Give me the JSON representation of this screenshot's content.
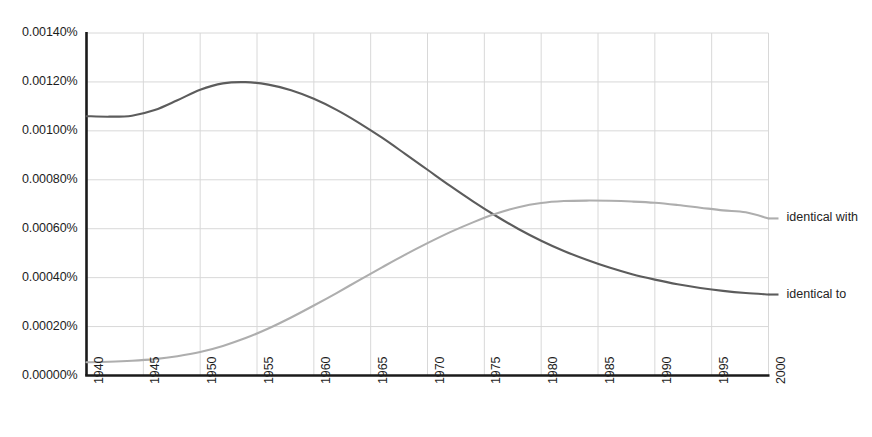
{
  "chart_data": {
    "type": "line",
    "title": "",
    "subtitle": "",
    "xlabel": "",
    "ylabel": "",
    "xlim": [
      1940,
      2000
    ],
    "ylim": [
      0.0,
      0.0014
    ],
    "grid": true,
    "legend_position": "right-inline",
    "y_tick_labels": [
      "0.00140%",
      "0.00120%",
      "0.00100%",
      "0.00080%",
      "0.00060%",
      "0.00040%",
      "0.00020%",
      "0.00000%"
    ],
    "y_tick_values": [
      0.0014,
      0.0012,
      0.001,
      0.0008,
      0.0006,
      0.0004,
      0.0002,
      0.0
    ],
    "x_tick_labels": [
      "1940",
      "1945",
      "1950",
      "1955",
      "1960",
      "1965",
      "1970",
      "1975",
      "1980",
      "1985",
      "1990",
      "1995",
      "2000"
    ],
    "x_tick_values": [
      1940,
      1945,
      1950,
      1955,
      1960,
      1965,
      1970,
      1975,
      1980,
      1985,
      1990,
      1995,
      2000
    ],
    "x": [
      1940,
      1942,
      1944,
      1946,
      1948,
      1950,
      1952,
      1954,
      1956,
      1958,
      1960,
      1962,
      1964,
      1966,
      1968,
      1970,
      1972,
      1974,
      1976,
      1978,
      1980,
      1982,
      1984,
      1986,
      1988,
      1990,
      1992,
      1994,
      1996,
      1998,
      2000
    ],
    "series": [
      {
        "name": "identical to",
        "color": "#5c5c5c",
        "values": [
          0.00106,
          0.001058,
          0.001062,
          0.001085,
          0.001125,
          0.001168,
          0.001194,
          0.001199,
          0.001189,
          0.001166,
          0.001131,
          0.001086,
          0.001032,
          0.000972,
          0.000907,
          0.000841,
          0.000775,
          0.000712,
          0.000653,
          0.000599,
          0.000551,
          0.000509,
          0.000473,
          0.000441,
          0.000414,
          0.000392,
          0.000373,
          0.000358,
          0.000346,
          0.000337,
          0.000331
        ]
      },
      {
        "name": "identical with",
        "color": "#aeaeae",
        "values": [
          5.4e-05,
          5.6e-05,
          6e-05,
          6.7e-05,
          7.9e-05,
          9.6e-05,
          0.000121,
          0.000153,
          0.000192,
          0.000237,
          0.000286,
          0.000337,
          0.00039,
          0.000442,
          0.000493,
          0.000541,
          0.000586,
          0.000626,
          0.000661,
          0.000688,
          0.000705,
          0.000713,
          0.000715,
          0.000714,
          0.000711,
          0.000706,
          0.000697,
          0.000686,
          0.000675,
          0.000667,
          0.000642
        ]
      }
    ],
    "axis_color": "#1a1a1a",
    "grid_color": "#d8d8d8"
  }
}
